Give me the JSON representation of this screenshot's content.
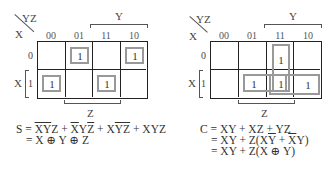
{
  "maps": [
    {
      "id": "sum",
      "corner_var_top": "YZ",
      "corner_var_left": "X",
      "column_headers": [
        "00",
        "01",
        "11",
        "10"
      ],
      "row_headers": [
        "0",
        "1"
      ],
      "cells": [
        [
          "",
          "1",
          "",
          "1"
        ],
        [
          "1",
          "",
          "1",
          ""
        ]
      ],
      "top_bracket_label": "Y",
      "left_bracket_label": "X",
      "bottom_bracket_label": "Z",
      "groups": [
        "m1",
        "m2",
        "m4",
        "m7"
      ]
    },
    {
      "id": "carry",
      "corner_var_top": "YZ",
      "corner_var_left": "X",
      "column_headers": [
        "00",
        "01",
        "11",
        "10"
      ],
      "row_headers": [
        "0",
        "1"
      ],
      "cells": [
        [
          "",
          "",
          "1",
          ""
        ],
        [
          "",
          "1",
          "1",
          "1"
        ]
      ],
      "top_bracket_label": "Y",
      "left_bracket_label": "X",
      "bottom_bracket_label": "Z",
      "groups": [
        "YZ (col 11)",
        "XZ (row1 col01-11)",
        "XY (row1 col11-10)"
      ]
    }
  ],
  "equations": {
    "sum": {
      "line1_prefix": "S = ",
      "line1_terms": [
        {
          "parts": [
            {
              "t": "X",
              "bar": true
            },
            {
              "t": "Y",
              "bar": true
            },
            {
              "t": "Z",
              "bar": false
            }
          ]
        },
        {
          "parts": [
            {
              "t": "X",
              "bar": true
            },
            {
              "t": "Y",
              "bar": false
            },
            {
              "t": "Z",
              "bar": true
            }
          ]
        },
        {
          "parts": [
            {
              "t": "X",
              "bar": false
            },
            {
              "t": "Y",
              "bar": true
            },
            {
              "t": "Z",
              "bar": true
            }
          ]
        },
        {
          "parts": [
            {
              "t": "XYZ",
              "bar": false
            }
          ]
        }
      ],
      "line2": "= X ⊕ Y ⊕ Z"
    },
    "carry": {
      "line1": "C = XY + XZ + YZ",
      "line2_prefix": "= XY + Z(X",
      "line2_ybar": "Y",
      "line2_mid": " + ",
      "line2_xbar": "X",
      "line2_suffix": "Y)",
      "line3": "= XY + Z(X ⊕ Y)"
    }
  },
  "plus": " + "
}
